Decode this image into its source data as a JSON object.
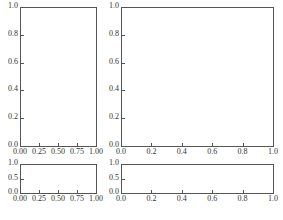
{
  "chart_data": [
    {
      "type": "line",
      "position": "top-left",
      "title": "",
      "xlabel": "",
      "ylabel": "",
      "xlim": [
        0,
        1
      ],
      "ylim": [
        0,
        1
      ],
      "xticks": [
        "0.00",
        "0.25",
        "0.50",
        "0.75",
        "1.00"
      ],
      "yticks": [
        "0.0",
        "0.2",
        "0.4",
        "0.6",
        "0.8",
        "1.0"
      ],
      "series": [],
      "grid": false
    },
    {
      "type": "line",
      "position": "top-right",
      "title": "",
      "xlabel": "",
      "ylabel": "",
      "xlim": [
        0,
        1
      ],
      "ylim": [
        0,
        1
      ],
      "xticks": [
        "0.0",
        "0.2",
        "0.4",
        "0.6",
        "0.8",
        "1.0"
      ],
      "yticks": [
        "0.0",
        "0.2",
        "0.4",
        "0.6",
        "0.8",
        "1.0"
      ],
      "series": [],
      "grid": false
    },
    {
      "type": "line",
      "position": "bottom-left",
      "title": "",
      "xlabel": "",
      "ylabel": "",
      "xlim": [
        0,
        1
      ],
      "ylim": [
        0,
        1
      ],
      "xticks": [
        "0.00",
        "0.25",
        "0.50",
        "0.75",
        "1.00"
      ],
      "yticks": [
        "0.0",
        "0.5",
        "1.0"
      ],
      "series": [],
      "grid": false
    },
    {
      "type": "line",
      "position": "bottom-right",
      "title": "",
      "xlabel": "",
      "ylabel": "",
      "xlim": [
        0,
        1
      ],
      "ylim": [
        0,
        1
      ],
      "xticks": [
        "0.0",
        "0.2",
        "0.4",
        "0.6",
        "0.8",
        "1.0"
      ],
      "yticks": [
        "0.0",
        "0.5",
        "1.0"
      ],
      "series": [],
      "grid": false
    }
  ],
  "figure": {
    "suptitle_partial": "(clipped caption text)"
  }
}
